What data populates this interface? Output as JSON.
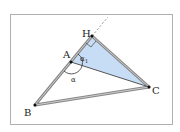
{
  "diagram": {
    "points": {
      "A": "A",
      "B": "B",
      "C": "C",
      "H": "H"
    },
    "angles": {
      "alpha": "α",
      "alpha1": "α",
      "alpha1_sub": "1"
    },
    "colors": {
      "frame": "#b0b0b0",
      "triangle_edge": "#777777",
      "shaded": "#c7dcf5",
      "dashed": "#999999"
    }
  }
}
